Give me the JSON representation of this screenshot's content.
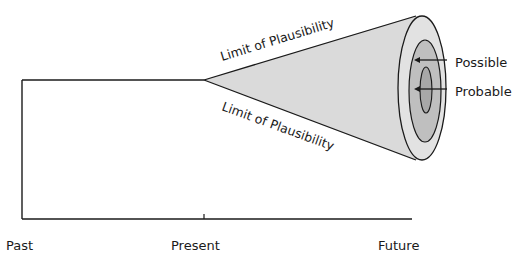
{
  "diagram": {
    "axis": {
      "labels": {
        "past": "Past",
        "present": "Present",
        "future": "Future"
      }
    },
    "cone": {
      "upper_edge_label": "Limit of Plausibility",
      "lower_edge_label": "Limit of Plausibility",
      "rings": [
        {
          "name": "Preferable/Outer (Plausible)",
          "label": ""
        },
        {
          "name": "Possible",
          "label": "Possible"
        },
        {
          "name": "Probable",
          "label": "Probable"
        }
      ]
    },
    "colors": {
      "line": "#1a1a1a",
      "cone_fill": "#d9d9d9",
      "outer_ring": "#e0e0e0",
      "middle_ring": "#bdbdbd",
      "inner_ring": "#a9a9a9"
    }
  }
}
